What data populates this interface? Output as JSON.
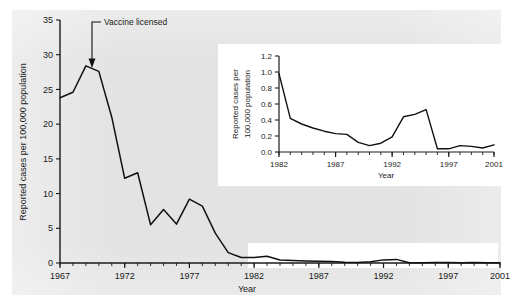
{
  "figure": {
    "background_color": "#e3e3e3",
    "card_color": "#ffffff",
    "line_color": "#111111"
  },
  "annotation": {
    "label": "Vaccine licensed",
    "year": 1969
  },
  "chart_data": [
    {
      "type": "line",
      "id": "main",
      "title": "",
      "xlabel": "Year",
      "ylabel": "Reported cases per 100,000 population",
      "xlim": [
        1967,
        2001
      ],
      "ylim": [
        0,
        35
      ],
      "yticks": [
        0,
        5,
        10,
        15,
        20,
        25,
        30,
        35
      ],
      "ytick_labels": [
        "0",
        "5",
        "10",
        "15",
        "20",
        "25",
        "30",
        "35"
      ],
      "xticks": [
        1967,
        1972,
        1977,
        1982,
        1987,
        1992,
        1997,
        2001
      ],
      "xtick_labels": [
        "1967",
        "1972",
        "1977",
        "1982",
        "1987",
        "1992",
        "1997",
        "2001"
      ],
      "minor_xtick_interval": 1,
      "grid": false,
      "legend": "none",
      "x": [
        1967,
        1968,
        1969,
        1970,
        1971,
        1972,
        1973,
        1974,
        1975,
        1976,
        1977,
        1978,
        1979,
        1980,
        1981,
        1982,
        1983,
        1984,
        1985,
        1986,
        1987,
        1988,
        1989,
        1990,
        1991,
        1992,
        1993,
        1994,
        1995,
        1996,
        1997,
        1998,
        1999,
        2000,
        2001
      ],
      "values": [
        23.8,
        24.6,
        28.4,
        27.6,
        21.0,
        12.2,
        13.0,
        5.5,
        7.7,
        5.6,
        9.2,
        8.2,
        4.3,
        1.5,
        0.8,
        0.8,
        0.97,
        0.42,
        0.35,
        0.3,
        0.25,
        0.23,
        0.12,
        0.08,
        0.18,
        0.45,
        0.52,
        0.04,
        0.05,
        0.08,
        0.07,
        0.04,
        0.09,
        0.05,
        0.02
      ]
    },
    {
      "type": "line",
      "id": "inset",
      "title": "",
      "xlabel": "Year",
      "ylabel": "Reported cases per 100,000 population",
      "ylabel_line1": "Reported cases per",
      "ylabel_line2": "100,000 population",
      "xlim": [
        1982,
        2001
      ],
      "ylim": [
        0,
        1.2
      ],
      "yticks": [
        0.0,
        0.2,
        0.4,
        0.6,
        0.8,
        1.0,
        1.2
      ],
      "ytick_labels": [
        "0.0",
        "0.2",
        "0.4",
        "0.6",
        "0.8",
        "1.0",
        "1.2"
      ],
      "xticks": [
        1982,
        1987,
        1992,
        1997,
        2001
      ],
      "xtick_labels": [
        "1982",
        "1987",
        "1992",
        "1997",
        "2001"
      ],
      "minor_xtick_interval": 1,
      "grid": false,
      "legend": "none",
      "x": [
        1982,
        1983,
        1984,
        1985,
        1986,
        1987,
        1988,
        1989,
        1990,
        1991,
        1992,
        1993,
        1994,
        1995,
        1996,
        1997,
        1998,
        1999,
        2000,
        2001
      ],
      "values": [
        0.98,
        0.42,
        0.35,
        0.3,
        0.26,
        0.23,
        0.22,
        0.12,
        0.08,
        0.11,
        0.19,
        0.44,
        0.47,
        0.53,
        0.04,
        0.04,
        0.08,
        0.07,
        0.05,
        0.09,
        0.08,
        0.05,
        0.17,
        0.12,
        0.07,
        0.03,
        0.02
      ]
    }
  ]
}
